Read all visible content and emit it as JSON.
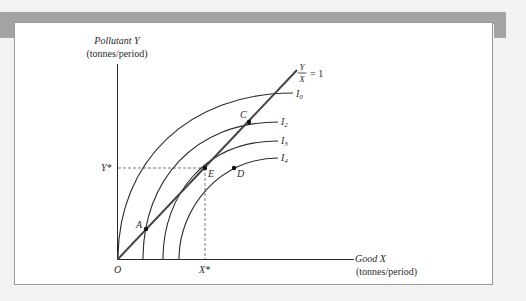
{
  "diagram": {
    "y_axis": {
      "title": "Pollutant Y",
      "units": "(tonnes/period)"
    },
    "x_axis": {
      "title": "Good X",
      "units": "(tonnes/period)"
    },
    "origin_label": "O",
    "ray": {
      "numerator": "Y",
      "denominator": "X",
      "equals": "= 1"
    },
    "curves": [
      {
        "label": "I",
        "subscript": "0"
      },
      {
        "label": "I",
        "subscript": "2"
      },
      {
        "label": "I",
        "subscript": "3"
      },
      {
        "label": "I",
        "subscript": "4"
      }
    ],
    "points": {
      "A": "A",
      "C": "C",
      "E": "E",
      "D": "D"
    },
    "reference": {
      "y_star": "Y*",
      "x_star": "X*"
    },
    "colors": {
      "line": "#2a2a2a",
      "ray": "#444444",
      "dashed": "#555555",
      "header_bar": "#a3a3a3",
      "panel_bg": "#ffffff",
      "page_bg": "#f2f2f2"
    }
  }
}
